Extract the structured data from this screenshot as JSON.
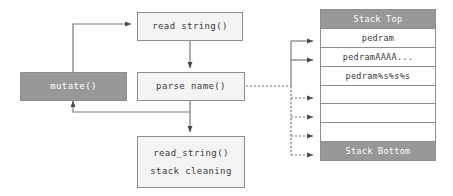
{
  "diagram": {
    "colors": {
      "shaded_fill": "#989898",
      "light_fill": "#f4f4f4",
      "stroke": "#8d8d8d",
      "text_dark": "#3b3b3b",
      "text_light": "#ffffff",
      "background": "#ffffff"
    },
    "nodes": [
      {
        "id": "read-string-top",
        "label": "read string()",
        "style": "light"
      },
      {
        "id": "mutate",
        "label": "mutate()",
        "style": "shaded"
      },
      {
        "id": "parse-name",
        "label": "parse name()",
        "style": "light"
      },
      {
        "id": "read-string-cleanup",
        "label_line1": "read_string()",
        "label_line2": "stack cleaning",
        "style": "light"
      }
    ],
    "stack": {
      "rows": [
        {
          "label": "Stack Top",
          "style": "shaded"
        },
        {
          "label": "pedram",
          "style": "plain"
        },
        {
          "label": "pedramAAAA...",
          "style": "plain"
        },
        {
          "label": "pedram%s%s%s",
          "style": "plain"
        },
        {
          "label": "",
          "style": "plain"
        },
        {
          "label": "",
          "style": "plain"
        },
        {
          "label": "",
          "style": "plain"
        },
        {
          "label": "Stack Bottom",
          "style": "shaded"
        }
      ]
    },
    "edges": [
      {
        "id": "mutate-to-read-string",
        "from": "mutate",
        "to": "read-string-top",
        "style": "solid"
      },
      {
        "id": "read-string-to-parse-name",
        "from": "read-string-top",
        "to": "parse-name",
        "style": "solid"
      },
      {
        "id": "parse-name-to-read-string-cleanup",
        "from": "parse-name",
        "to": "read-string-cleanup",
        "style": "solid"
      },
      {
        "id": "parse-name-to-mutate-feedback",
        "from": "parse-name",
        "to": "mutate",
        "style": "solid"
      },
      {
        "id": "trunk-to-stack-row-1",
        "from": "parse-name",
        "to": "stack-row-1",
        "style": "solid"
      },
      {
        "id": "trunk-to-stack-row-2",
        "from": "parse-name",
        "to": "stack-row-2",
        "style": "solid"
      },
      {
        "id": "trunk-to-stack-row-4",
        "from": "parse-name",
        "to": "stack-row-4",
        "style": "dashed"
      },
      {
        "id": "trunk-to-stack-row-5",
        "from": "parse-name",
        "to": "stack-row-5",
        "style": "dashed"
      },
      {
        "id": "trunk-to-stack-row-6",
        "from": "parse-name",
        "to": "stack-row-6",
        "style": "dashed"
      },
      {
        "id": "trunk-to-stack-row-7",
        "from": "parse-name",
        "to": "stack-row-7",
        "style": "dashed"
      }
    ]
  }
}
